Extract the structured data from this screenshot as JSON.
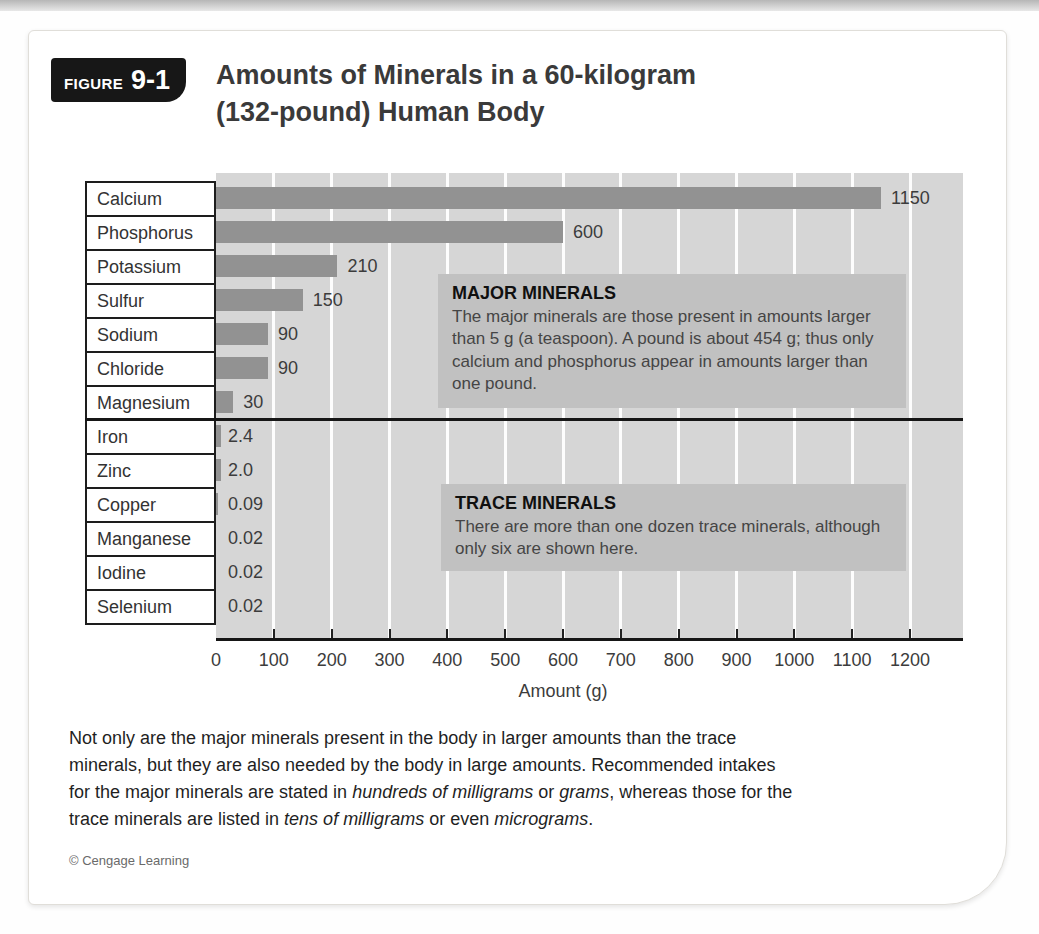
{
  "figure": {
    "badge_word": "FIGURE",
    "badge_number": "9-1",
    "title_line1": "Amounts of Minerals in a 60-kilogram",
    "title_line2": "(132-pound) Human Body"
  },
  "chart_data": {
    "type": "bar",
    "orientation": "horizontal",
    "categories": [
      "Calcium",
      "Phosphorus",
      "Potassium",
      "Sulfur",
      "Sodium",
      "Chloride",
      "Magnesium",
      "Iron",
      "Zinc",
      "Copper",
      "Manganese",
      "Iodine",
      "Selenium"
    ],
    "values": [
      1150,
      600,
      210,
      150,
      90,
      90,
      30,
      2.4,
      2,
      0.09,
      0.02,
      0.02,
      0.02
    ],
    "value_labels": [
      "1150",
      "600",
      "210",
      "150",
      "90",
      "90",
      "30",
      "2.4",
      "2.0",
      "0.09",
      "0.02",
      "0.02",
      "0.02"
    ],
    "major_mineral_count": 7,
    "xlabel": "Amount (g)",
    "x_ticks": [
      0,
      100,
      200,
      300,
      400,
      500,
      600,
      700,
      800,
      900,
      1000,
      1100,
      1200
    ],
    "xlim": [
      0,
      1290
    ],
    "grid": "on",
    "colors": {
      "bar": "#929292",
      "plot_background": "#d6d6d6",
      "gridline": "#fdfdfd",
      "annotation_background": "#c1c1c1",
      "axis": "#161616"
    },
    "annotations": [
      {
        "title": "MAJOR MINERALS",
        "body": "The major minerals are those present in amounts larger than 5 g (a teaspoon). A pound is about 454 g; thus only calcium and phosphorus appear in amounts larger than one pound."
      },
      {
        "title": "TRACE MINERALS",
        "body": "There are more than one dozen trace minerals, although only six are shown here."
      }
    ]
  },
  "caption": {
    "lines": [
      [
        {
          "t": "Not only are the major minerals present in the body in larger amounts than the trace"
        }
      ],
      [
        {
          "t": "minerals, but they are also needed by the body in large amounts. Recommended intakes"
        }
      ],
      [
        {
          "t": "for the major minerals are stated in "
        },
        {
          "t": "hundreds of milligrams",
          "i": true
        },
        {
          "t": " or "
        },
        {
          "t": "grams",
          "i": true
        },
        {
          "t": ", whereas those for the"
        }
      ],
      [
        {
          "t": "trace minerals are listed in "
        },
        {
          "t": "tens of milligrams",
          "i": true
        },
        {
          "t": " or even "
        },
        {
          "t": "micrograms",
          "i": true
        },
        {
          "t": "."
        }
      ]
    ]
  },
  "credit": "© Cengage Learning"
}
